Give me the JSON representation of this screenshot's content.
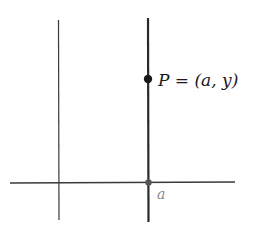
{
  "diagram": {
    "point_label": "P = (a, y)",
    "point_label_parts": {
      "name": "P",
      "equals": "=",
      "open": "(",
      "x": "a",
      "comma": ",",
      "y": "y",
      "close": ")"
    },
    "axis_tick_label": "a",
    "colors": {
      "axis": "#3a3a3a",
      "vertical_line": "#2a2a2a",
      "point": "#1a1a1a",
      "text": "#1a1a1a",
      "tick_label": "#8a8a8a",
      "background": "#ffffff"
    }
  }
}
